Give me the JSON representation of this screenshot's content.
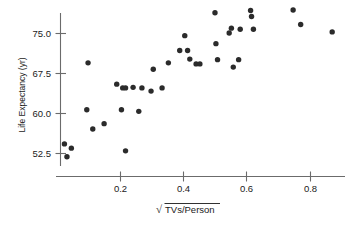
{
  "chart_data": {
    "type": "scatter",
    "title": "",
    "subtitle": "",
    "xlabel": "√TVs/Person",
    "xlabel_radical_content": "TVs/Person",
    "ylabel": "Life Expectancy (yr)",
    "xlim": [
      0.0,
      0.92
    ],
    "ylim": [
      50.0,
      80.5
    ],
    "xticks": [
      0.2,
      0.4,
      0.6,
      0.8
    ],
    "xtick_labels": [
      "0.2",
      "0.4",
      "0.6",
      "0.8"
    ],
    "yticks": [
      52.5,
      60.0,
      67.5,
      75.0
    ],
    "ytick_labels": [
      "52.5",
      "60.0",
      "67.5",
      "75.0"
    ],
    "grid": false,
    "legend": null,
    "marker": "filled-circle",
    "marker_color": "#2b2b2b",
    "axis_color": "#6b6b6b",
    "points": [
      {
        "x": 0.022,
        "y": 54.3
      },
      {
        "x": 0.03,
        "y": 51.9
      },
      {
        "x": 0.044,
        "y": 53.5
      },
      {
        "x": 0.093,
        "y": 60.7
      },
      {
        "x": 0.097,
        "y": 69.5
      },
      {
        "x": 0.112,
        "y": 57.1
      },
      {
        "x": 0.148,
        "y": 58.1
      },
      {
        "x": 0.188,
        "y": 65.5
      },
      {
        "x": 0.203,
        "y": 60.7
      },
      {
        "x": 0.207,
        "y": 64.8
      },
      {
        "x": 0.216,
        "y": 64.8
      },
      {
        "x": 0.216,
        "y": 53.0
      },
      {
        "x": 0.24,
        "y": 64.9
      },
      {
        "x": 0.258,
        "y": 60.4
      },
      {
        "x": 0.268,
        "y": 64.8
      },
      {
        "x": 0.297,
        "y": 64.2
      },
      {
        "x": 0.304,
        "y": 68.3
      },
      {
        "x": 0.332,
        "y": 64.8
      },
      {
        "x": 0.352,
        "y": 69.5
      },
      {
        "x": 0.388,
        "y": 71.8
      },
      {
        "x": 0.404,
        "y": 74.6
      },
      {
        "x": 0.413,
        "y": 71.8
      },
      {
        "x": 0.42,
        "y": 70.2
      },
      {
        "x": 0.44,
        "y": 69.3
      },
      {
        "x": 0.452,
        "y": 69.3
      },
      {
        "x": 0.5,
        "y": 78.9
      },
      {
        "x": 0.503,
        "y": 73.1
      },
      {
        "x": 0.508,
        "y": 70.1
      },
      {
        "x": 0.545,
        "y": 75.1
      },
      {
        "x": 0.552,
        "y": 76.0
      },
      {
        "x": 0.558,
        "y": 68.7
      },
      {
        "x": 0.575,
        "y": 70.1
      },
      {
        "x": 0.58,
        "y": 75.8
      },
      {
        "x": 0.613,
        "y": 79.3
      },
      {
        "x": 0.616,
        "y": 78.2
      },
      {
        "x": 0.622,
        "y": 75.8
      },
      {
        "x": 0.748,
        "y": 79.4
      },
      {
        "x": 0.772,
        "y": 76.7
      },
      {
        "x": 0.872,
        "y": 75.3
      }
    ]
  },
  "axes": {
    "y_axis_title": "Life Expectancy (yr)",
    "x_axis_radical_symbol": "√",
    "x_axis_radicand": "TVs/Person"
  }
}
